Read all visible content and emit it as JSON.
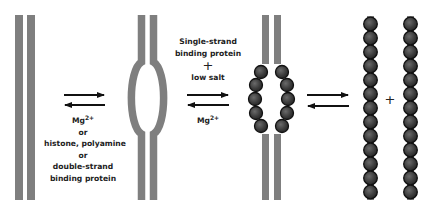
{
  "figure": {
    "title": "",
    "stages": [
      {
        "name": "double-stranded DNA"
      },
      {
        "name": "DNA with melted bubble"
      },
      {
        "name": "bubble coated with single-strand binding protein"
      },
      {
        "name": "fully separated single strands coated with binding protein"
      }
    ],
    "step1_conditions": {
      "line1": "Mg",
      "line1_sup": "2+",
      "line2": "or",
      "line3": "histone, polyamine",
      "line4": "or",
      "line5": "double-strand",
      "line6": "binding protein"
    },
    "step2_conditions": {
      "line1": "Single-strand",
      "line2": "binding protein",
      "plus": "+",
      "line3": "low salt",
      "reverse": "Mg",
      "reverse_sup": "2+"
    },
    "final_plus": "+",
    "colors": {
      "strand": "#7f7f7f",
      "bead": "#3d3d3d",
      "bead_outline": "#111111",
      "arrow": "#111111"
    }
  }
}
